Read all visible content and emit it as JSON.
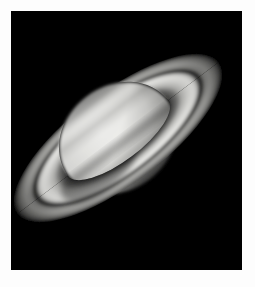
{
  "page": {
    "background_color": "#fdfdfd",
    "width": 255,
    "height": 287
  },
  "photo": {
    "title": "Saturn",
    "alt_text": "Telescopic grayscale photograph of the planet Saturn with its ring system tilted from upper left to lower right",
    "background_color": "#000000",
    "frame": {
      "x": 11,
      "y": 11,
      "width": 231,
      "height": 259
    },
    "palette": {
      "space_black": "#000000",
      "planet_bright": "#e8e8e6",
      "planet_mid": "#c9c9c6",
      "planet_dim": "#9a9a97",
      "planet_limb": "#4d4d4b",
      "ring_b_bright": "#e3e3e0",
      "ring_a_mid": "#a8a8a5",
      "ring_outer_dim": "#6e6e6c",
      "cassini_division": "#232323",
      "shadow": "#0a0a0a"
    }
  },
  "scene": {
    "type": "astronomical-photograph",
    "subject": "Saturn",
    "planet": {
      "center_x": 118,
      "center_y": 138,
      "semi_major_x": 52,
      "semi_minor_y": 62,
      "rotation_deg": -37,
      "oblate": true,
      "bands": [
        {
          "name": "north-polar-region",
          "offset": -0.72,
          "thickness": 0.22,
          "brightness": 0.62
        },
        {
          "name": "north-temperate-belt",
          "offset": -0.42,
          "thickness": 0.16,
          "brightness": 0.8
        },
        {
          "name": "equatorial-zone",
          "offset": -0.05,
          "thickness": 0.4,
          "brightness": 1.0
        },
        {
          "name": "south-equatorial-belt",
          "offset": 0.34,
          "thickness": 0.2,
          "brightness": 0.74
        },
        {
          "name": "south-polar-region",
          "offset": 0.74,
          "thickness": 0.22,
          "brightness": 0.5
        }
      ]
    },
    "rings": {
      "tilt_deg": -37,
      "center_x": 118,
      "center_y": 138,
      "outer_radius_x": 126,
      "outer_radius_y": 46,
      "annuli": [
        {
          "name": "outer-a-ring-edge",
          "r_outer": 1.0,
          "r_inner": 0.93,
          "brightness": 0.42
        },
        {
          "name": "a-ring",
          "r_outer": 0.93,
          "r_inner": 0.8,
          "brightness": 0.62
        },
        {
          "name": "cassini-division",
          "r_outer": 0.8,
          "r_inner": 0.755,
          "brightness": 0.1
        },
        {
          "name": "b-ring-outer",
          "r_outer": 0.755,
          "r_inner": 0.64,
          "brightness": 1.0
        },
        {
          "name": "b-ring-inner",
          "r_outer": 0.64,
          "r_inner": 0.555,
          "brightness": 0.84
        },
        {
          "name": "c-ring",
          "r_outer": 0.555,
          "r_inner": 0.5,
          "brightness": 0.34
        }
      ],
      "ansa_upper_left": {
        "x": 28,
        "y": 38
      },
      "ansa_lower_right": {
        "x": 212,
        "y": 228
      },
      "front_arc_crosses_planet": "upper-third",
      "shadow_on_rings": true
    }
  }
}
